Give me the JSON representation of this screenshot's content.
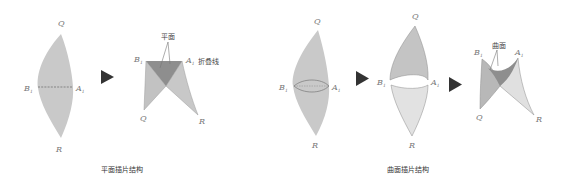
{
  "colors": {
    "fill_light": "#cfcfcf",
    "fill_mid": "#bdbdbd",
    "fill_dark": "#8f8f8f",
    "fill_pale": "#e3e3e3",
    "stroke": "#9a9a9a",
    "arrow": "#333333"
  },
  "left_group": {
    "caption": "平面插片结构",
    "flat": {
      "q": "Q",
      "r": "R",
      "b": "B",
      "b_sub": "1",
      "a": "A",
      "a_sub": "1"
    },
    "folded": {
      "q": "Q",
      "r": "R",
      "b": "B",
      "b_sub": "1",
      "a": "A",
      "a_sub": "1",
      "plane_label": "平面",
      "fold_label": "折叠线"
    }
  },
  "right_group": {
    "caption": "曲面插片结构",
    "flat": {
      "q": "Q",
      "r": "R",
      "b": "B",
      "b_sub": "1",
      "a": "A",
      "a_sub": "1"
    },
    "split": {
      "q": "Q",
      "r": "R",
      "b": "B",
      "b_sub": "1",
      "a": "A",
      "a_sub": "1"
    },
    "folded": {
      "q": "Q",
      "r": "R",
      "b": "B",
      "b_sub": "1",
      "a": "A",
      "a_sub": "1",
      "surface_label": "曲面"
    }
  }
}
